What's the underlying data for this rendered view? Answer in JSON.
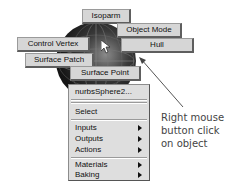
{
  "marking_menu": {
    "north": "Isoparm",
    "northeast": "Object Mode",
    "west": "Control Vertex",
    "east": "Hull",
    "southwest": "Surface Patch",
    "south": "Surface Point"
  },
  "context_menu": {
    "title": "nurbsSphere2...",
    "items": [
      {
        "label": "Select",
        "submenu": false
      },
      {
        "label": "Inputs",
        "submenu": true
      },
      {
        "label": "Outputs",
        "submenu": true
      },
      {
        "label": "Actions",
        "submenu": true
      },
      {
        "label": "Materials",
        "submenu": true
      },
      {
        "label": "Baking",
        "submenu": true
      }
    ]
  },
  "annotation": {
    "lines": [
      "Right mouse",
      "button click",
      "on object"
    ]
  },
  "colors": {
    "menu_bg": "#dedede",
    "button_bg": "#d6d6d6",
    "annotation_text": "#444444"
  }
}
